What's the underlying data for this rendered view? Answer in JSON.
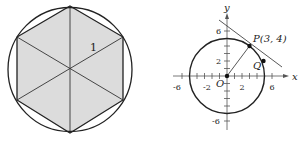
{
  "left_figure": {
    "description": "Regular hexagon inscribed in a circle, divided into 6 triangles",
    "side_label": "1",
    "fill_color": "#dcdcdc",
    "stroke_color": "#222222"
  },
  "right_figure": {
    "axis_x_label": "x",
    "axis_y_label": "y",
    "x_ticks": [
      "-6",
      "-2",
      "2",
      "6"
    ],
    "y_ticks": [
      "6",
      "2",
      "-6"
    ],
    "origin_label": "O",
    "point_p_label": "P(3, 4)",
    "point_q_label": "Q",
    "circle_radius": 5,
    "point_p": [
      3,
      4
    ]
  }
}
